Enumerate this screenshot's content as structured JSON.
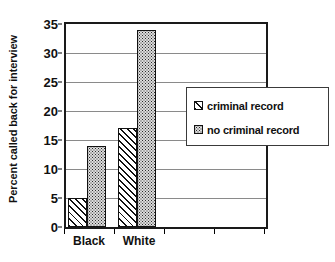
{
  "chart_data": {
    "type": "bar",
    "title": "",
    "subtitle": "",
    "xlabel": "",
    "ylabel": "Percent called back for interview",
    "categories": [
      "Black",
      "White",
      "",
      ""
    ],
    "series": [
      {
        "name": "criminal record",
        "values": [
          5,
          17,
          null,
          null
        ],
        "pattern": "diagonal-hatch"
      },
      {
        "name": "no criminal record",
        "values": [
          14,
          34,
          null,
          null
        ],
        "pattern": "dotted-stipple"
      }
    ],
    "ylim": [
      0,
      35
    ],
    "yticks": [
      0,
      5,
      10,
      15,
      20,
      25,
      30,
      35
    ],
    "ytick_labels": [
      "0",
      "5",
      "10",
      "15",
      "20",
      "25",
      "30",
      "35"
    ],
    "grid": true,
    "grid_axis": "y",
    "legend_position": "center-right",
    "colors": {
      "axis": "#1a1a1a",
      "gridline": "#8a8a8a",
      "bar_outline": "#111111",
      "hatch_fill": "#ffffff",
      "dots_fill": "#dcdcdc",
      "background": "#ffffff",
      "text": "#111111"
    }
  },
  "axes": {
    "y_title": "Percent called back for interview",
    "y_ticks": [
      {
        "label": "35",
        "value": 35
      },
      {
        "label": "30",
        "value": 30
      },
      {
        "label": "25",
        "value": 25
      },
      {
        "label": "20",
        "value": 20
      },
      {
        "label": "15",
        "value": 15
      },
      {
        "label": "10",
        "value": 10
      },
      {
        "label": "5",
        "value": 5
      },
      {
        "label": "0",
        "value": 0
      }
    ],
    "x_categories": [
      {
        "label": "Black"
      },
      {
        "label": "White"
      },
      {
        "label": ""
      },
      {
        "label": ""
      }
    ]
  },
  "legend": {
    "items": [
      {
        "label": "criminal record",
        "pattern": "diagonal-hatch"
      },
      {
        "label": "no criminal record",
        "pattern": "dotted-stipple"
      }
    ]
  }
}
